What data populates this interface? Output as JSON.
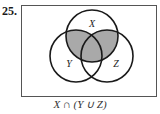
{
  "problem_number": "25.",
  "diagram": {
    "type": "venn",
    "sets": [
      {
        "label": "X",
        "cx": 92,
        "cy": 36,
        "r": 26
      },
      {
        "label": "Y",
        "cx": 76,
        "cy": 56,
        "r": 26
      },
      {
        "label": "Z",
        "cx": 107,
        "cy": 56,
        "r": 26
      }
    ],
    "shaded_region": "X ∩ (Y ∪ Z)",
    "shade_color": "#a9a9a9",
    "stroke_color": "#1a1a1a"
  },
  "caption": "X ∩ (Y ∪ Z)"
}
